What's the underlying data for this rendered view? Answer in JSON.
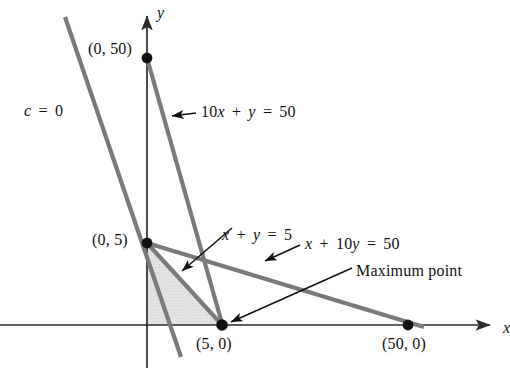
{
  "figure": {
    "type": "linear-programming-feasible-region",
    "background_color": "#ffffff",
    "line_color": "#7a7a7a",
    "axis_color": "#2b2b2b",
    "shade_color": "#e2e2e2",
    "dot_color": "#111111"
  },
  "axes": {
    "x_label": "x",
    "y_label": "y",
    "origin_px": [
      147,
      325
    ],
    "x_axis_y_px": 325,
    "y_axis_x_px": 147,
    "x_arrow_end_px": 497,
    "y_arrow_end_px": 8,
    "scale_x_px_per_unit": 5.22,
    "scale_y_px_per_unit": 5.34
  },
  "labels": {
    "objective": "c = 0",
    "constraint_1": "10x + y = 50",
    "constraint_2": "x + y = 5",
    "constraint_3": "x + 10y = 50",
    "maximum_point": "Maximum point",
    "point_0_50": "(0, 50)",
    "point_0_5": "(0, 5)",
    "point_5_0": "(5, 0)",
    "point_50_0": "(50, 0)"
  },
  "chart_data": {
    "type": "line",
    "title": "",
    "xlabel": "x",
    "ylabel": "y",
    "xlim": [
      -16,
      67
    ],
    "ylim": [
      -8,
      59
    ],
    "grid": false,
    "legend": "none",
    "series": [
      {
        "name": "10x + y = 50",
        "equation": "10x + y = 50",
        "points": [
          [
            0,
            50
          ],
          [
            5,
            0
          ]
        ],
        "color": "#7a7a7a",
        "label_anchor": [
          10.5,
          37.5
        ]
      },
      {
        "name": "x + y = 5",
        "equation": "x + y = 5",
        "points": [
          [
            0,
            5
          ],
          [
            5,
            0
          ]
        ],
        "color": "#7a7a7a",
        "label_anchor": [
          18.5,
          22.5
        ]
      },
      {
        "name": "x + 10y = 50",
        "equation": "x + 10y = 50",
        "points": [
          [
            0,
            5
          ],
          [
            50,
            0
          ]
        ],
        "color": "#7a7a7a",
        "label_anchor": [
          23.5,
          16.5
        ]
      },
      {
        "name": "c = 0",
        "equation": "c = 0",
        "points": [
          [
            -15.7,
            57.5
          ],
          [
            -6.3,
            -5.6
          ]
        ],
        "color": "#7a7a7a",
        "label_anchor": [
          -17.5,
          41.0
        ]
      }
    ],
    "marked_points": [
      {
        "label": "(0, 50)",
        "x": 0,
        "y": 50
      },
      {
        "label": "(0, 5)",
        "x": 0,
        "y": 5
      },
      {
        "label": "(5, 0)",
        "x": 5,
        "y": 0,
        "annotation": "Maximum point"
      },
      {
        "label": "(50, 0)",
        "x": 50,
        "y": 0
      }
    ],
    "shaded_region": {
      "name": "feasible-region",
      "vertices": [
        [
          0,
          0
        ],
        [
          0,
          5
        ],
        [
          5,
          0
        ]
      ],
      "fill": "#e2e2e2"
    },
    "annotations": [
      {
        "text": "c = 0",
        "target": "c = 0 line"
      },
      {
        "text": "10x + y = 50",
        "target": "10x + y = 50 line",
        "arrow": true
      },
      {
        "text": "x + y = 5",
        "target": "x + y = 5 line",
        "arrow": true
      },
      {
        "text": "x + 10y = 50",
        "target": "x + 10y = 50 line",
        "arrow": true
      },
      {
        "text": "Maximum point",
        "target": "(5, 0)",
        "arrow": true
      }
    ]
  }
}
